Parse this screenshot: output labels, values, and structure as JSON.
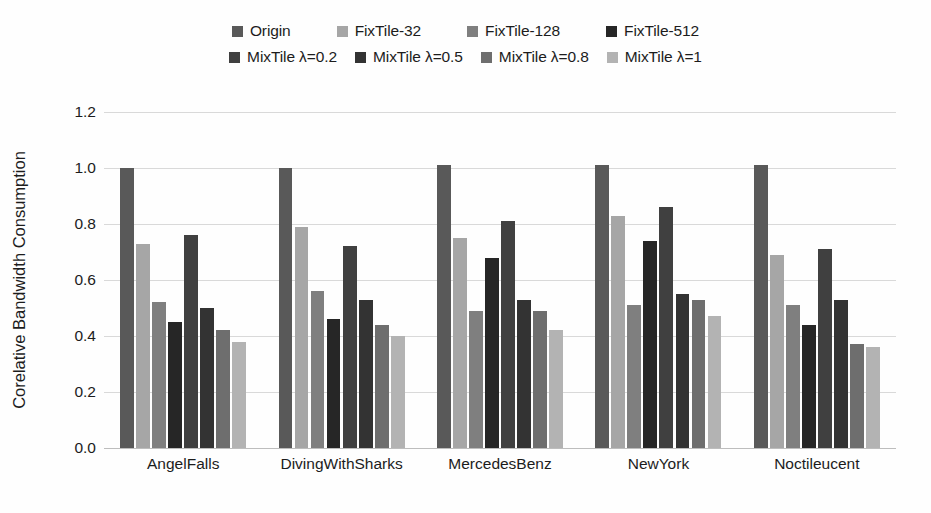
{
  "chart_data": {
    "type": "bar",
    "title": "",
    "xlabel": "",
    "ylabel": "Corelative Bandwidth Consumption",
    "ylim": [
      0.0,
      1.2
    ],
    "ytick_labels": [
      "1.2",
      "1.0",
      "0.8",
      "0.6",
      "0.4",
      "0.2",
      "0.0"
    ],
    "ytick_values": [
      1.2,
      1.0,
      0.8,
      0.6,
      0.4,
      0.2,
      0.0
    ],
    "grid": true,
    "legend_position": "top",
    "categories": [
      "AngelFalls",
      "DivingWithSharks",
      "MercedesBenz",
      "NewYork",
      "Noctileucent"
    ],
    "series": [
      {
        "name": "Origin",
        "color": "#595959",
        "values": [
          1.0,
          1.0,
          1.01,
          1.01,
          1.01
        ]
      },
      {
        "name": "FixTile-32",
        "color": "#a6a6a6",
        "values": [
          0.73,
          0.79,
          0.75,
          0.83,
          0.69
        ]
      },
      {
        "name": "FixTile-128",
        "color": "#7f7f7f",
        "values": [
          0.52,
          0.56,
          0.49,
          0.51,
          0.51
        ]
      },
      {
        "name": "FixTile-512",
        "color": "#262626",
        "values": [
          0.45,
          0.46,
          0.68,
          0.74,
          0.44
        ]
      },
      {
        "name": "MixTile λ=0.2",
        "color": "#404040",
        "values": [
          0.76,
          0.72,
          0.81,
          0.86,
          0.71
        ]
      },
      {
        "name": "MixTile λ=0.5",
        "color": "#333333",
        "values": [
          0.5,
          0.53,
          0.53,
          0.55,
          0.53
        ]
      },
      {
        "name": "MixTile λ=0.8",
        "color": "#6e6e6e",
        "values": [
          0.42,
          0.44,
          0.49,
          0.53,
          0.37
        ]
      },
      {
        "name": "MixTile λ=1",
        "color": "#b3b3b3",
        "values": [
          0.38,
          0.4,
          0.42,
          0.47,
          0.36
        ]
      }
    ]
  },
  "legend": {
    "rows": [
      [
        {
          "label": "Origin",
          "color": "#595959"
        },
        {
          "label": "FixTile-32",
          "color": "#a6a6a6"
        },
        {
          "label": "FixTile-128",
          "color": "#7f7f7f"
        },
        {
          "label": "FixTile-512",
          "color": "#262626"
        }
      ],
      [
        {
          "label": "MixTile λ=0.2",
          "color": "#404040"
        },
        {
          "label": "MixTile λ=0.5",
          "color": "#333333"
        },
        {
          "label": "MixTile λ=0.8",
          "color": "#6e6e6e"
        },
        {
          "label": "MixTile λ=1",
          "color": "#b3b3b3"
        }
      ]
    ]
  }
}
